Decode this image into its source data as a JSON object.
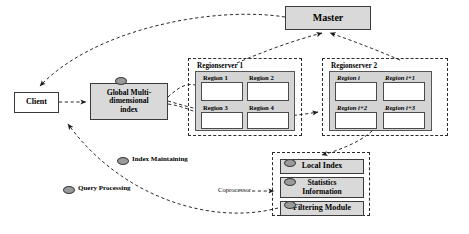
{
  "diagram": {
    "title_nodes": {
      "master": "Master",
      "client": "Client",
      "global_index": "Global Multi-\ndimensional\nindex",
      "global_index_line1": "Global Multi-",
      "global_index_line2": "dimensional",
      "global_index_line3": "index",
      "local_index": "Local Index",
      "statistics_line1": "Statistics",
      "statistics_line2": "Information",
      "statistics": "Statistics Information",
      "filtering_module": "Filtering Module",
      "coprocessor": "Coprocessor"
    },
    "regionservers": [
      {
        "name": "Regionserver 1",
        "regions": [
          {
            "label": "Region 1",
            "italic": false
          },
          {
            "label": "Region 2",
            "italic": false
          },
          {
            "label": "Region 3",
            "italic": false
          },
          {
            "label": "Region 4",
            "italic": false
          }
        ]
      },
      {
        "name": "Regionserver 2",
        "regions": [
          {
            "label": "Region i",
            "italic": true
          },
          {
            "label": "Region i+1",
            "italic": true
          },
          {
            "label": "Region i+2",
            "italic": true
          },
          {
            "label": "Region i+3",
            "italic": true
          }
        ]
      }
    ],
    "legend": [
      {
        "label": "Index Maintaining",
        "icon": "oval-icon"
      },
      {
        "label": "Query Processing",
        "icon": "oval-icon"
      }
    ],
    "colors": {
      "node_fill": "#d9d9d9",
      "panel_fill": "#d4d4d4",
      "region_fill": "#ffffff",
      "stroke": "#2b2b2b",
      "oval_fill": "#9a9a9a"
    }
  }
}
